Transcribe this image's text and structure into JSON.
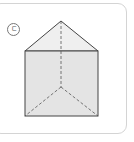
{
  "figure": {
    "label": "ㄷ",
    "shape": "triangular-prism",
    "colors": {
      "face_fill": "#e4e4e4",
      "top_fill": "#efefef",
      "edge": "#444444",
      "hidden_edge": "#555555",
      "card_border": "#d4d4d4"
    }
  }
}
